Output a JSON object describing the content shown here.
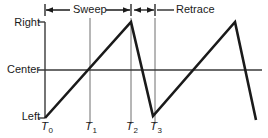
{
  "figure": {
    "axis_labels": {
      "right": "Right",
      "center": "Center",
      "left": "Left"
    },
    "time_labels": [
      {
        "base": "T",
        "sub": "0"
      },
      {
        "base": "T",
        "sub": "1"
      },
      {
        "base": "T",
        "sub": "2"
      },
      {
        "base": "T",
        "sub": "3"
      }
    ],
    "span_labels": {
      "sweep": "Sweep",
      "retrace": "Retrace"
    },
    "colors": {
      "waveform": "#1a1a1a",
      "axis": "#4a4a4a",
      "gridline": "#6e6e6e",
      "annotation": "#1a1a1a",
      "background": "#ffffff"
    }
  },
  "chart_data": {
    "type": "line",
    "xlabel": "",
    "ylabel": "",
    "xlim": [
      45,
      262
    ],
    "ylim": [
      22,
      118
    ],
    "grid": true,
    "legend": null,
    "y_tick_labels": [
      "Right",
      "Center",
      "Left"
    ],
    "y_tick_values": [
      22,
      70,
      118
    ],
    "x_tick_labels": [
      "T0",
      "T1",
      "T2",
      "T3"
    ],
    "x_tick_values": [
      45,
      90,
      131,
      155
    ],
    "series": [
      {
        "name": "beam-position",
        "points": [
          {
            "x": 45,
            "y": 118
          },
          {
            "x": 131,
            "y": 22
          },
          {
            "x": 153,
            "y": 116
          },
          {
            "x": 235,
            "y": 22
          },
          {
            "x": 256,
            "y": 120
          }
        ]
      }
    ],
    "annotations": [
      {
        "label": "Sweep",
        "from_x": 45,
        "to_x": 131,
        "y": 10
      },
      {
        "label": "Retrace",
        "from_x": 133,
        "to_x": 155,
        "y": 10
      }
    ]
  }
}
